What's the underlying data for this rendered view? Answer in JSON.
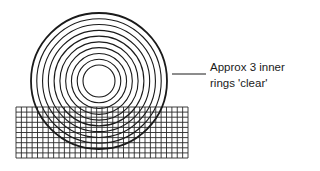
{
  "diagram": {
    "annotation": {
      "line1": "Approx 3 inner",
      "line2": "rings 'clear'"
    },
    "rings": {
      "center": [
        99,
        81
      ],
      "outer_radius": 68,
      "inner_radius": 16,
      "count": 10,
      "stroke_color": "#1a1a1a"
    },
    "grid": {
      "x0": 16,
      "y0": 107,
      "x1": 188,
      "y1": 158,
      "cols": 32,
      "rows": 10,
      "stroke_color": "#2a2a2a"
    },
    "leader": {
      "x1": 172,
      "y1": 74,
      "x2": 206,
      "y2": 74
    }
  }
}
